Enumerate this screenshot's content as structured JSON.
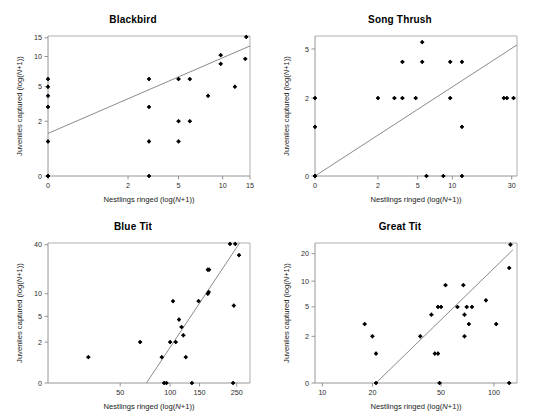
{
  "figure": {
    "panel_count": 4,
    "background": "#ffffff",
    "point_color": "#000000",
    "line_color": "#7d7d7d"
  },
  "axis_labels": {
    "x_prefix": "Nestlings ringed (log(",
    "x_italic": "N",
    "x_suffix": "+1))",
    "y_prefix": "Juveniles captured (log(",
    "y_italic": "N",
    "y_suffix": "+1))"
  },
  "chart_data": [
    {
      "type": "scatter",
      "title": "Blackbird",
      "xlabel": "Nestlings ringed (log(N+1))",
      "ylabel": "Juveniles captured (log(N+1))",
      "xticks": [
        0,
        2,
        5,
        10,
        15
      ],
      "yticks": [
        0,
        2,
        5,
        10,
        15
      ],
      "xticklabels": [
        "0",
        "2",
        "5",
        "10",
        "15"
      ],
      "yticklabels": [
        "0",
        "2",
        "5",
        "10",
        "15"
      ],
      "scale": "log1p",
      "xlim": [
        0,
        15
      ],
      "ylim": [
        0,
        15.6
      ],
      "grid": false,
      "legend": null,
      "points": [
        {
          "x": 0,
          "y": 0
        },
        {
          "x": 0,
          "y": 0
        },
        {
          "x": 0,
          "y": 1
        },
        {
          "x": 0,
          "y": 3
        },
        {
          "x": 0,
          "y": 4
        },
        {
          "x": 0,
          "y": 5
        },
        {
          "x": 0,
          "y": 6
        },
        {
          "x": 3,
          "y": 0
        },
        {
          "x": 3,
          "y": 1
        },
        {
          "x": 3,
          "y": 3
        },
        {
          "x": 3,
          "y": 6
        },
        {
          "x": 5,
          "y": 1
        },
        {
          "x": 5,
          "y": 2
        },
        {
          "x": 5,
          "y": 6
        },
        {
          "x": 6,
          "y": 2
        },
        {
          "x": 6,
          "y": 6
        },
        {
          "x": 8,
          "y": 4
        },
        {
          "x": 9.7,
          "y": 8.5
        },
        {
          "x": 9.7,
          "y": 10.3
        },
        {
          "x": 12,
          "y": 5
        },
        {
          "x": 14,
          "y": 9.5
        },
        {
          "x": 14.2,
          "y": 15.3
        }
      ],
      "trendline": {
        "x1": 0,
        "y1": 1.35,
        "x2": 15,
        "y2": 12.6
      }
    },
    {
      "type": "scatter",
      "title": "Song Thrush",
      "xlabel": "Nestlings ringed (log(N+1))",
      "ylabel": "Juveniles captured (log(N+1))",
      "xticks": [
        0,
        2,
        5,
        10,
        30
      ],
      "yticks": [
        0,
        2,
        5
      ],
      "xticklabels": [
        "0",
        "2",
        "5",
        "10",
        "30"
      ],
      "yticklabels": [
        "0",
        "2",
        "5"
      ],
      "scale": "log1p",
      "xlim": [
        0,
        33
      ],
      "ylim": [
        0,
        6.2
      ],
      "grid": false,
      "legend": null,
      "points": [
        {
          "x": 0,
          "y": 0
        },
        {
          "x": 0,
          "y": 0
        },
        {
          "x": 0,
          "y": 0
        },
        {
          "x": 0,
          "y": 1
        },
        {
          "x": 0,
          "y": 2
        },
        {
          "x": 2,
          "y": 2
        },
        {
          "x": 3,
          "y": 2
        },
        {
          "x": 3.6,
          "y": 2
        },
        {
          "x": 3.6,
          "y": 4
        },
        {
          "x": 4.8,
          "y": 2
        },
        {
          "x": 5.5,
          "y": 4
        },
        {
          "x": 5.5,
          "y": 5.6
        },
        {
          "x": 6,
          "y": 0
        },
        {
          "x": 8.4,
          "y": 0
        },
        {
          "x": 9.6,
          "y": 2
        },
        {
          "x": 9.6,
          "y": 4
        },
        {
          "x": 12,
          "y": 0
        },
        {
          "x": 12,
          "y": 1
        },
        {
          "x": 12,
          "y": 4
        },
        {
          "x": 26,
          "y": 2
        },
        {
          "x": 27.5,
          "y": 2
        },
        {
          "x": 31,
          "y": 2
        }
      ],
      "trendline": {
        "x1": 0,
        "y1": 0,
        "x2": 33,
        "y2": 5.35
      }
    },
    {
      "type": "scatter",
      "title": "Blue Tit",
      "xlabel": "Nestlings ringed (log(N+1))",
      "ylabel": "Juveniles captured (log(N+1))",
      "xticks": [
        50,
        100,
        150,
        250
      ],
      "yticks": [
        0,
        2,
        5,
        10,
        40
      ],
      "xticklabels": [
        "50",
        "100",
        "150",
        "250"
      ],
      "yticklabels": [
        "0",
        "2",
        "5",
        "10",
        "40"
      ],
      "scale": "log1p",
      "xlim": [
        18,
        300
      ],
      "ylim": [
        0,
        42
      ],
      "grid": false,
      "legend": null,
      "points": [
        {
          "x": 32,
          "y": 1
        },
        {
          "x": 66,
          "y": 2
        },
        {
          "x": 89,
          "y": 1
        },
        {
          "x": 92,
          "y": 0
        },
        {
          "x": 95,
          "y": 0
        },
        {
          "x": 100,
          "y": 2
        },
        {
          "x": 104,
          "y": 8
        },
        {
          "x": 108,
          "y": 2
        },
        {
          "x": 113,
          "y": 4.5
        },
        {
          "x": 117,
          "y": 3.5
        },
        {
          "x": 120,
          "y": 2.6
        },
        {
          "x": 124,
          "y": 1
        },
        {
          "x": 135,
          "y": 0
        },
        {
          "x": 148,
          "y": 8
        },
        {
          "x": 168,
          "y": 10
        },
        {
          "x": 170,
          "y": 10.5
        },
        {
          "x": 168,
          "y": 20
        },
        {
          "x": 171,
          "y": 20
        },
        {
          "x": 228,
          "y": 41
        },
        {
          "x": 238,
          "y": 0
        },
        {
          "x": 240,
          "y": 7
        },
        {
          "x": 245,
          "y": 41
        },
        {
          "x": 258,
          "y": 30
        }
      ],
      "trendline": {
        "x1": 72,
        "y1": 0,
        "x2": 262,
        "y2": 43
      }
    },
    {
      "type": "scatter",
      "title": "Great Tit",
      "xlabel": "Nestlings ringed (log(N+1))",
      "ylabel": "Juveniles captured (log(N+1))",
      "xticks": [
        10,
        20,
        50,
        100
      ],
      "yticks": [
        0,
        2,
        5,
        10,
        20
      ],
      "xticklabels": [
        "10",
        "20",
        "50",
        "100"
      ],
      "yticklabels": [
        "0",
        "2",
        "5",
        "10",
        "20"
      ],
      "scale": "log1p",
      "xlim": [
        9,
        135
      ],
      "ylim": [
        0,
        26
      ],
      "grid": false,
      "legend": null,
      "points": [
        {
          "x": 18,
          "y": 3
        },
        {
          "x": 20,
          "y": 2
        },
        {
          "x": 21,
          "y": 0
        },
        {
          "x": 21,
          "y": 1
        },
        {
          "x": 38,
          "y": 2
        },
        {
          "x": 44,
          "y": 4
        },
        {
          "x": 46,
          "y": 1
        },
        {
          "x": 48,
          "y": 1
        },
        {
          "x": 48,
          "y": 5
        },
        {
          "x": 50,
          "y": 5
        },
        {
          "x": 49,
          "y": 0
        },
        {
          "x": 53,
          "y": 9
        },
        {
          "x": 62,
          "y": 5
        },
        {
          "x": 67,
          "y": 9
        },
        {
          "x": 68,
          "y": 2
        },
        {
          "x": 68,
          "y": 4
        },
        {
          "x": 70,
          "y": 5
        },
        {
          "x": 72,
          "y": 3
        },
        {
          "x": 75,
          "y": 5
        },
        {
          "x": 90,
          "y": 6
        },
        {
          "x": 103,
          "y": 3
        },
        {
          "x": 122,
          "y": 0
        },
        {
          "x": 122,
          "y": 14
        },
        {
          "x": 124,
          "y": 25
        }
      ],
      "trendline": {
        "x1": 21,
        "y1": 0,
        "x2": 128,
        "y2": 22
      }
    }
  ]
}
